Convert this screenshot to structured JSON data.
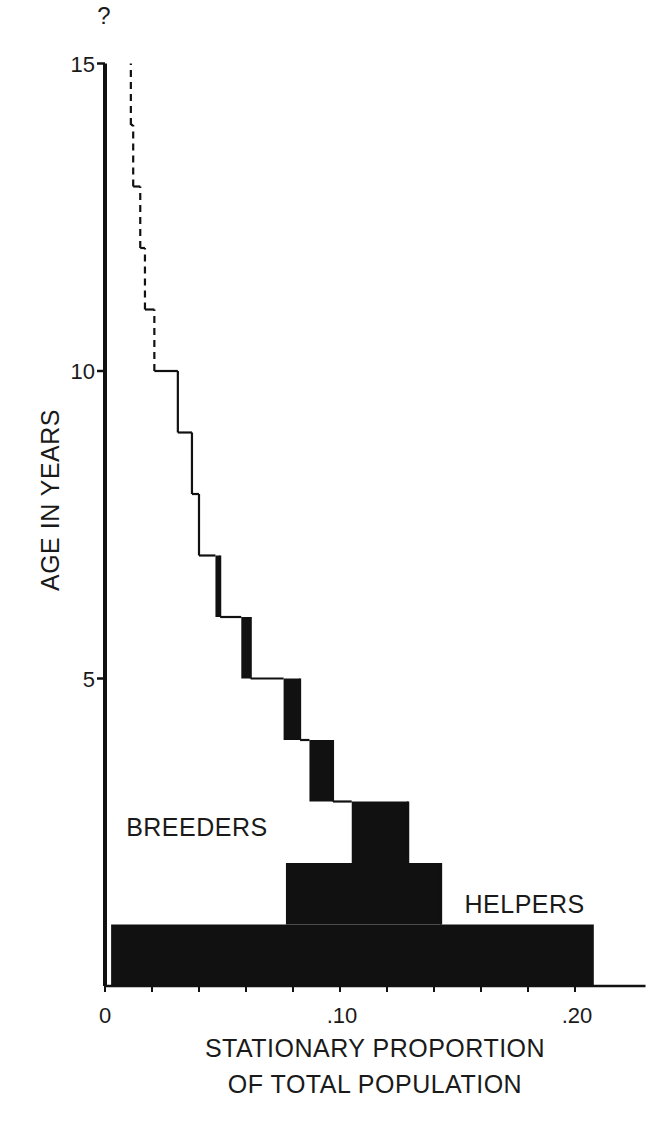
{
  "chart_data": {
    "type": "bar",
    "orientation": "horizontal-stepped-age-pyramid",
    "title": "",
    "xlabel_lines": [
      "STATIONARY PROPORTION",
      "OF TOTAL POPULATION"
    ],
    "ylabel": "AGE IN YEARS",
    "xlim": [
      0,
      0.23
    ],
    "ylim": [
      0,
      15
    ],
    "x_ticks": [
      {
        "value": 0,
        "label": "0"
      },
      {
        "value": 0.1,
        "label": ".10"
      },
      {
        "value": 0.2,
        "label": ".20"
      }
    ],
    "x_minor_tick_step": 0.02,
    "y_ticks": [
      {
        "value": 5,
        "label": "5"
      },
      {
        "value": 10,
        "label": "10"
      },
      {
        "value": 15,
        "label": "15"
      }
    ],
    "y_top_annotation": "?",
    "grid": false,
    "legend": null,
    "annotations": [
      {
        "text": "BREEDERS",
        "x": 0.009,
        "y": 2.6
      },
      {
        "text": "HELPERS",
        "x": 0.153,
        "y": 1.35
      }
    ],
    "categories": [
      "0-1",
      "1-2",
      "2-3",
      "3-4",
      "4-5",
      "5-6",
      "6-7",
      "7-8",
      "8-9",
      "9-10",
      "10-11",
      "11-12",
      "12-13",
      "13-14",
      "14-15"
    ],
    "series": [
      {
        "name": "Breeders (cumulative boundary, open region)",
        "values": [
          0.0,
          0.077,
          0.105,
          0.087,
          0.076,
          0.058,
          0.047,
          0.04,
          0.037,
          0.031,
          0.021,
          0.017,
          0.015,
          0.012,
          0.011
        ]
      },
      {
        "name": "Helpers (filled black)",
        "values": [
          0.208,
          0.066,
          0.024,
          0.01,
          0.007,
          0.004,
          0.002,
          0,
          0,
          0,
          0,
          0,
          0,
          0,
          0
        ]
      },
      {
        "name": "Total",
        "values": [
          0.208,
          0.143,
          0.129,
          0.097,
          0.083,
          0.062,
          0.049,
          0.04,
          0.037,
          0.031,
          0.021,
          0.017,
          0.015,
          0.012,
          0.011
        ]
      }
    ],
    "dashed_from_age": 10,
    "colors": {
      "helpers_fill": "#111111",
      "line": "#111111",
      "background": "#ffffff"
    }
  }
}
